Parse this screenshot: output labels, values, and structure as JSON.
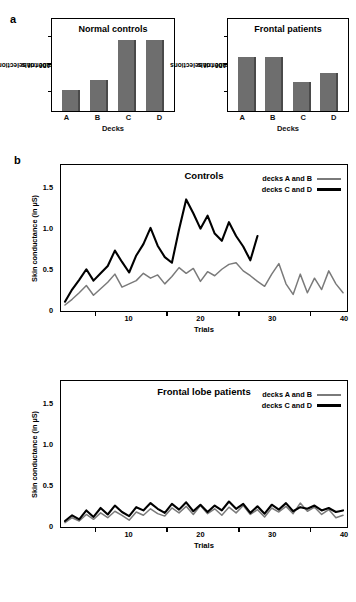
{
  "figure": {
    "panel_a_letter": "a",
    "panel_b_letter": "b"
  },
  "panel_a": {
    "charts": [
      {
        "title": "Normal controls",
        "ylabel": "Number of selections\nover 100 trials",
        "ylabel_line1": "Number of selections",
        "ylabel_line2": "over 100 trials",
        "xlabel": "Decks",
        "categories": [
          "A",
          "B",
          "C",
          "D"
        ],
        "values": [
          18,
          27,
          62,
          62
        ]
      },
      {
        "title": "Frontal patients",
        "ylabel_line1": "Number of selections",
        "ylabel_line2": "over 100 trials",
        "xlabel": "Decks",
        "categories": [
          "A",
          "B",
          "C",
          "D"
        ],
        "values": [
          47,
          47,
          25,
          33
        ]
      }
    ]
  },
  "panel_b": {
    "charts": [
      {
        "title": "Controls",
        "ylabel": "Skin conductance (in µS)",
        "xlabel": "Trials",
        "y_ticks": [
          "0",
          "0.5",
          "1.0",
          "1.5"
        ],
        "x_ticks": [
          "10",
          "20",
          "30",
          "40"
        ],
        "legend": [
          {
            "label": "decks A and B",
            "color": "#7a7a7a"
          },
          {
            "label": "decks C and D",
            "color": "#000000"
          }
        ]
      },
      {
        "title": "Frontal lobe patients",
        "ylabel": "Skin conductance (in µS)",
        "xlabel": "Trials",
        "y_ticks": [
          "0",
          "0.5",
          "1.0",
          "1.5"
        ],
        "x_ticks": [
          "10",
          "20",
          "30",
          "40"
        ],
        "legend": [
          {
            "label": "decks A and B",
            "color": "#7a7a7a"
          },
          {
            "label": "decks C and D",
            "color": "#000000"
          }
        ]
      }
    ]
  },
  "chart_data": [
    {
      "type": "bar",
      "title": "Normal controls",
      "xlabel": "Decks",
      "ylabel": "Number of selections over 100 trials",
      "categories": [
        "A",
        "B",
        "C",
        "D"
      ],
      "values": [
        18,
        27,
        62,
        62
      ],
      "ylim": [
        0,
        80
      ],
      "grid": false
    },
    {
      "type": "bar",
      "title": "Frontal patients",
      "xlabel": "Decks",
      "ylabel": "Number of selections over 100 trials",
      "categories": [
        "A",
        "B",
        "C",
        "D"
      ],
      "values": [
        47,
        47,
        25,
        33
      ],
      "ylim": [
        0,
        80
      ],
      "grid": false
    },
    {
      "type": "line",
      "title": "Controls",
      "xlabel": "Trials",
      "ylabel": "Skin conductance (in µS)",
      "xlim": [
        1,
        40
      ],
      "ylim": [
        0,
        1.75
      ],
      "yticks": [
        0,
        0.5,
        1.0,
        1.5
      ],
      "xticks": [
        10,
        20,
        30,
        40
      ],
      "grid": false,
      "legend_position": "top-right",
      "series": [
        {
          "name": "decks A and B",
          "color": "#7a7a7a",
          "x": [
            1,
            2,
            3,
            4,
            5,
            6,
            7,
            8,
            9,
            10,
            11,
            12,
            13,
            14,
            15,
            16,
            17,
            18,
            19,
            20,
            21,
            22,
            23,
            24,
            25,
            26,
            27,
            28,
            29,
            30,
            31,
            32,
            33,
            34,
            35,
            36,
            37,
            38,
            39,
            40
          ],
          "values": [
            0.05,
            0.12,
            0.2,
            0.29,
            0.17,
            0.25,
            0.33,
            0.43,
            0.27,
            0.31,
            0.35,
            0.44,
            0.38,
            0.42,
            0.31,
            0.4,
            0.51,
            0.44,
            0.5,
            0.34,
            0.46,
            0.41,
            0.49,
            0.55,
            0.57,
            0.47,
            0.41,
            0.34,
            0.28,
            0.43,
            0.56,
            0.31,
            0.18,
            0.43,
            0.2,
            0.38,
            0.24,
            0.47,
            0.31,
            0.2
          ]
        },
        {
          "name": "decks C and D",
          "color": "#000000",
          "x": [
            1,
            2,
            3,
            4,
            5,
            6,
            7,
            8,
            9,
            10,
            11,
            12,
            13,
            14,
            15,
            16,
            17,
            18,
            19,
            20,
            21,
            22,
            23,
            24,
            25,
            26,
            27,
            28
          ],
          "values": [
            0.09,
            0.24,
            0.36,
            0.49,
            0.35,
            0.44,
            0.53,
            0.72,
            0.58,
            0.45,
            0.66,
            0.8,
            1.0,
            0.78,
            0.64,
            0.57,
            0.98,
            1.35,
            1.18,
            0.99,
            1.15,
            0.93,
            0.84,
            1.07,
            0.9,
            0.77,
            0.6,
            0.9
          ]
        }
      ]
    },
    {
      "type": "line",
      "title": "Frontal lobe patients",
      "xlabel": "Trials",
      "ylabel": "Skin conductance (in µS)",
      "xlim": [
        1,
        40
      ],
      "ylim": [
        0,
        1.75
      ],
      "yticks": [
        0,
        0.5,
        1.0,
        1.5
      ],
      "xticks": [
        10,
        20,
        30,
        40
      ],
      "grid": false,
      "legend_position": "top-right",
      "series": [
        {
          "name": "decks A and B",
          "color": "#7a7a7a",
          "x": [
            1,
            2,
            3,
            4,
            5,
            6,
            7,
            8,
            9,
            10,
            11,
            12,
            13,
            14,
            15,
            16,
            17,
            18,
            19,
            20,
            21,
            22,
            23,
            24,
            25,
            26,
            27,
            28,
            29,
            30,
            31,
            32,
            33,
            34,
            35,
            36,
            37,
            38,
            39,
            40
          ],
          "values": [
            0.03,
            0.09,
            0.05,
            0.13,
            0.07,
            0.15,
            0.09,
            0.17,
            0.12,
            0.06,
            0.16,
            0.12,
            0.2,
            0.14,
            0.11,
            0.21,
            0.15,
            0.23,
            0.13,
            0.24,
            0.14,
            0.2,
            0.12,
            0.22,
            0.15,
            0.24,
            0.13,
            0.19,
            0.1,
            0.21,
            0.16,
            0.23,
            0.14,
            0.27,
            0.17,
            0.22,
            0.13,
            0.19,
            0.09,
            0.12
          ]
        },
        {
          "name": "decks C and D",
          "color": "#000000",
          "x": [
            1,
            2,
            3,
            4,
            5,
            6,
            7,
            8,
            9,
            10,
            11,
            12,
            13,
            14,
            15,
            16,
            17,
            18,
            19,
            20,
            21,
            22,
            23,
            24,
            25,
            26,
            27,
            28,
            29,
            30,
            31,
            32,
            33,
            34,
            35,
            36,
            37,
            38,
            39,
            40
          ],
          "values": [
            0.05,
            0.12,
            0.07,
            0.18,
            0.1,
            0.21,
            0.13,
            0.24,
            0.16,
            0.11,
            0.22,
            0.18,
            0.27,
            0.2,
            0.15,
            0.26,
            0.19,
            0.28,
            0.17,
            0.25,
            0.16,
            0.24,
            0.18,
            0.29,
            0.2,
            0.26,
            0.15,
            0.23,
            0.14,
            0.25,
            0.19,
            0.27,
            0.17,
            0.22,
            0.2,
            0.24,
            0.18,
            0.21,
            0.16,
            0.18
          ]
        }
      ]
    }
  ]
}
